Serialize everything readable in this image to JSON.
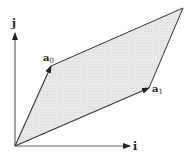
{
  "diagram": {
    "type": "vector-parallelogram",
    "colors": {
      "fill": "#e6e6e6",
      "stroke": "#333333",
      "axis": "#555555",
      "text": "#222222"
    },
    "origin": [
      15,
      146
    ],
    "axes": {
      "i": {
        "label": "i",
        "tip": [
          130,
          146
        ]
      },
      "j": {
        "label": "j",
        "tip": [
          15,
          33
        ]
      }
    },
    "vectors": {
      "a0": {
        "label": "a",
        "subscript": "0",
        "tip": [
          51,
          66
        ]
      },
      "a1": {
        "label": "a",
        "subscript": "1",
        "tip": [
          149,
          88
        ]
      }
    },
    "parallelogram": {
      "vertices": [
        [
          15,
          146
        ],
        [
          149,
          88
        ],
        [
          183,
          8
        ],
        [
          51,
          66
        ]
      ],
      "far_corner": [
        183,
        8
      ]
    }
  }
}
